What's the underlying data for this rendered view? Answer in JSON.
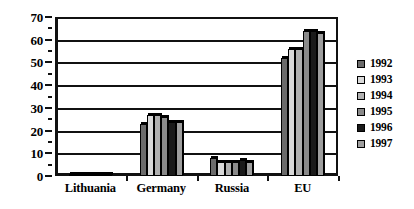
{
  "chart_data": {
    "type": "bar",
    "title": "",
    "subtitle": "",
    "xlabel": "",
    "ylabel": "",
    "ylim": [
      0,
      70
    ],
    "ytick_interval": 10,
    "yminor_interval": 5,
    "ytick_labels": [
      "0",
      "10",
      "20",
      "30",
      "40",
      "50",
      "60",
      "70"
    ],
    "grid": true,
    "grid_axis": "y",
    "legend_position": "right",
    "categories": [
      "Lithuania",
      "Germany",
      "Russia",
      "EU"
    ],
    "series": [
      {
        "name": "1992",
        "color": "#6b6b6b",
        "values": [
          1,
          23,
          8,
          52
        ]
      },
      {
        "name": "1993",
        "color": "#d9d9d9",
        "values": [
          1,
          27,
          6,
          56
        ]
      },
      {
        "name": "1994",
        "color": "#b0b0b0",
        "values": [
          1,
          27,
          6,
          56
        ]
      },
      {
        "name": "1995",
        "color": "#8a8a8a",
        "values": [
          1,
          26,
          6,
          64
        ]
      },
      {
        "name": "1996",
        "color": "#1a1a1a",
        "values": [
          1,
          24,
          7,
          64
        ]
      },
      {
        "name": "1997",
        "color": "#9e9e9e",
        "values": [
          1,
          24,
          6,
          63
        ]
      }
    ]
  },
  "legend": {
    "entries": [
      {
        "label": "1992"
      },
      {
        "label": "1993"
      },
      {
        "label": "1994"
      },
      {
        "label": "1995"
      },
      {
        "label": "1996"
      },
      {
        "label": "1997"
      }
    ]
  },
  "axis": {
    "y_labels": [
      "70",
      "60",
      "50",
      "40",
      "30",
      "20",
      "10",
      "0"
    ]
  },
  "x_labels": [
    "Lithuania",
    "Germany",
    "Russia",
    "EU"
  ]
}
